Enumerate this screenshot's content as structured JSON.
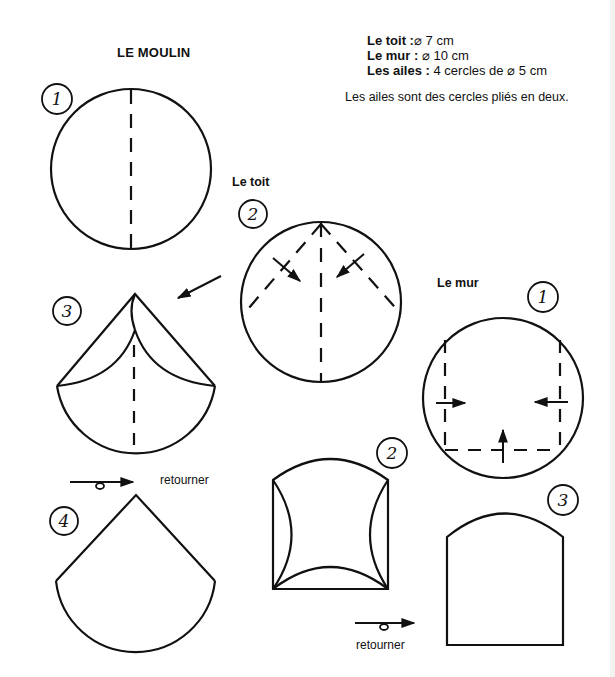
{
  "title": "LE MOULIN",
  "specs": [
    {
      "label": "Le toit :",
      "value": "⌀ 7 cm"
    },
    {
      "label": "Le mur :",
      "value": " ⌀ 10 cm"
    },
    {
      "label": "Les ailes :",
      "value": " 4 cercles de ⌀ 5 cm"
    }
  ],
  "note": "Les ailes sont des cercles pliés en deux.",
  "sections": {
    "toit": {
      "label": "Le toit"
    },
    "mur": {
      "label": "Le mur"
    }
  },
  "retourner_label": "retourner",
  "colors": {
    "ink": "#111111",
    "paper": "#ffffff",
    "edge_strip": "#f2f2f2"
  },
  "steps": {
    "toit": [
      {
        "num": "1",
        "badge": [
          57,
          99
        ]
      },
      {
        "num": "2",
        "badge": [
          253,
          214
        ]
      },
      {
        "num": "3",
        "badge": [
          67,
          311
        ]
      },
      {
        "num": "4",
        "badge": [
          64,
          521
        ]
      }
    ],
    "mur": [
      {
        "num": "1",
        "badge": [
          543,
          297
        ]
      },
      {
        "num": "2",
        "badge": [
          392,
          453
        ]
      },
      {
        "num": "3",
        "badge": [
          563,
          500
        ]
      }
    ]
  }
}
